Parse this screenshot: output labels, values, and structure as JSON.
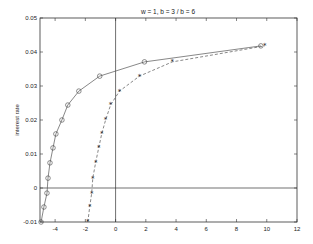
{
  "chart_data": {
    "type": "line",
    "title": "w = 1, b = 3 / b = 6",
    "xlabel": "",
    "ylabel": "interest rate",
    "xlim": [
      -5,
      12
    ],
    "ylim": [
      -0.01,
      0.05
    ],
    "grid": false,
    "legend": null,
    "xticks": [
      -4,
      -2,
      0,
      2,
      4,
      6,
      8,
      10,
      12
    ],
    "xtick_labels": [
      "-4",
      "-2",
      "0",
      "2",
      "4",
      "6",
      "8",
      "10",
      "12"
    ],
    "yticks": [
      -0.01,
      0,
      0.01,
      0.02,
      0.03,
      0.04,
      0.05
    ],
    "ytick_labels": [
      "-0.01",
      "0",
      "0.01",
      "0.02",
      "0.03",
      "0.04",
      "0.05"
    ],
    "reference_lines": {
      "horizontal_y": 0,
      "vertical_x": 0
    },
    "series": [
      {
        "name": "b = 3",
        "style": "solid line with circle markers",
        "color": "#555555",
        "x": [
          -4.93,
          -4.74,
          -4.54,
          -4.47,
          -4.34,
          -4.14,
          -3.95,
          -3.55,
          -3.16,
          -2.43,
          -1.05,
          1.91,
          9.61
        ],
        "y": [
          -0.01,
          -0.0056,
          -0.0015,
          0.0029,
          0.0074,
          0.0118,
          0.0159,
          0.02,
          0.0244,
          0.0285,
          0.0329,
          0.0371,
          0.0418
        ]
      },
      {
        "name": "b = 6",
        "style": "dashed line with star markers",
        "color": "#555555",
        "x": [
          -1.84,
          -1.71,
          -1.58,
          -1.51,
          -1.32,
          -1.12,
          -0.92,
          -0.66,
          -0.33,
          0.26,
          1.58,
          3.75,
          9.87
        ],
        "y": [
          -0.01,
          -0.0056,
          -0.0015,
          0.0029,
          0.0074,
          0.0118,
          0.0159,
          0.02,
          0.0244,
          0.0285,
          0.0329,
          0.0371,
          0.0418
        ]
      }
    ]
  }
}
